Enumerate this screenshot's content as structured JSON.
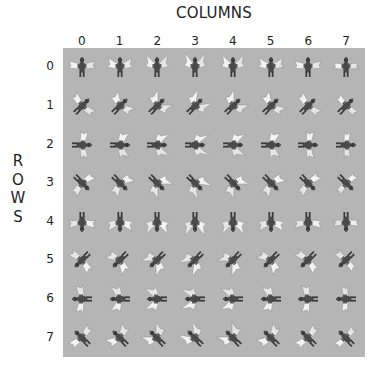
{
  "header": {
    "columns_title": "COLUMNS",
    "rows_title": "ROWS"
  },
  "columns": [
    "0",
    "1",
    "2",
    "3",
    "4",
    "5",
    "6",
    "7"
  ],
  "rows": [
    "0",
    "1",
    "2",
    "3",
    "4",
    "5",
    "6",
    "7"
  ],
  "grid": {
    "background_color": "#b5b5b5",
    "cell_count": 64,
    "content": "winged creature sprite animation frames",
    "row_orientations_deg": [
      0,
      45,
      90,
      135,
      180,
      225,
      270,
      315
    ]
  }
}
